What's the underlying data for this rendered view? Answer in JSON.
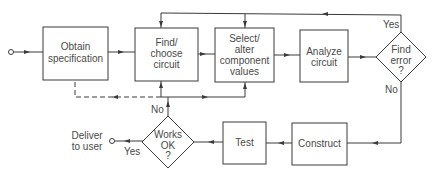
{
  "diagram": {
    "type": "flowchart",
    "nodes": {
      "obtain": {
        "line1": "Obtain",
        "line2": "specification"
      },
      "find": {
        "line1": "Find/",
        "line2": "choose",
        "line3": "circuit"
      },
      "select": {
        "line1": "Select/",
        "line2": "alter",
        "line3": "component",
        "line4": "values"
      },
      "analyze": {
        "line1": "Analyze",
        "line2": "circuit"
      },
      "find_error": {
        "line1": "Find",
        "line2": "error",
        "line3": "?"
      },
      "construct": {
        "line1": "Construct"
      },
      "test": {
        "line1": "Test"
      },
      "works_ok": {
        "line1": "Works",
        "line2": "OK",
        "line3": "?"
      },
      "deliver": {
        "line1": "Deliver",
        "line2": "to user"
      }
    },
    "labels": {
      "find_error_yes": "Yes",
      "find_error_no": "No",
      "works_ok_yes": "Yes",
      "works_ok_no": "No"
    },
    "edges": [
      {
        "from": "start",
        "to": "obtain"
      },
      {
        "from": "obtain",
        "to": "find"
      },
      {
        "from": "find",
        "to": "select"
      },
      {
        "from": "select",
        "to": "analyze"
      },
      {
        "from": "analyze",
        "to": "find_error"
      },
      {
        "from": "find_error",
        "to": "find",
        "label": "Yes"
      },
      {
        "from": "find_error",
        "to": "select",
        "label": "Yes"
      },
      {
        "from": "find_error",
        "to": "construct",
        "label": "No"
      },
      {
        "from": "construct",
        "to": "test"
      },
      {
        "from": "test",
        "to": "works_ok"
      },
      {
        "from": "works_ok",
        "to": "deliver",
        "label": "Yes"
      },
      {
        "from": "works_ok",
        "to": "find",
        "label": "No"
      },
      {
        "from": "works_ok",
        "to": "select",
        "label": "No"
      },
      {
        "from": "works_ok",
        "to": "obtain",
        "label": "No",
        "style": "dashed"
      }
    ]
  }
}
